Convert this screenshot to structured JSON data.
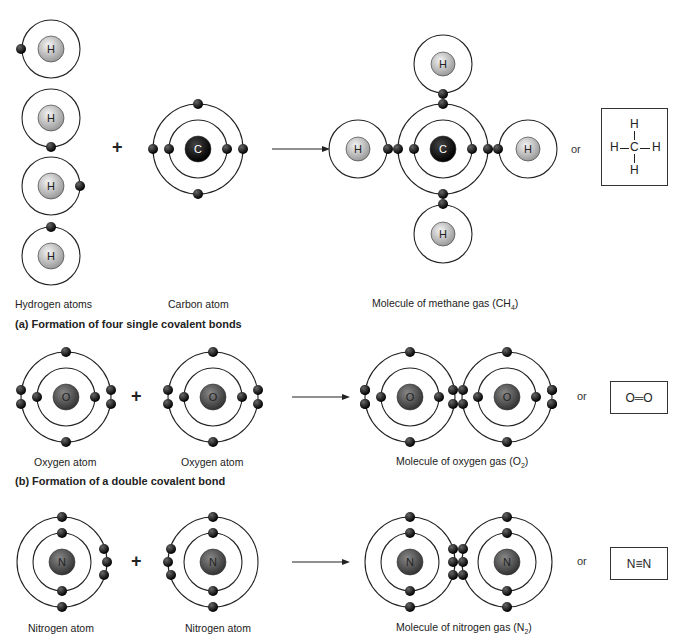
{
  "section_a": {
    "caption": "(a) Formation of four single covalent bonds",
    "hydrogen_label": "Hydrogen atoms",
    "carbon_label": "Carbon atom",
    "methane_label": "Molecule of methane gas (CH",
    "methane_sub": "4",
    "methane_close": ")",
    "or": "or",
    "plus": "+",
    "structural": {
      "top": "H",
      "left": "H",
      "center": "C",
      "right": "H",
      "bottom": "H"
    },
    "nucleus_h": "H",
    "nucleus_c": "C"
  },
  "section_b": {
    "caption": "(b) Formation of a double covalent bond",
    "oxygen_label_1": "Oxygen atom",
    "oxygen_label_2": "Oxygen atom",
    "molecule_label": "Molecule of oxygen gas (O",
    "molecule_sub": "2",
    "molecule_close": ")",
    "or": "or",
    "plus": "+",
    "formula": "O═O",
    "nucleus": "O"
  },
  "section_c": {
    "nitrogen_label_1": "Nitrogen atom",
    "nitrogen_label_2": "Nitrogen atom",
    "molecule_label": "Molecule of nitrogen gas (N",
    "molecule_sub": "2",
    "molecule_close": ")",
    "or": "or",
    "plus": "+",
    "formula": "N≡N",
    "nucleus": "N"
  },
  "colors": {
    "electron": "#111111",
    "h_nucleus": "#c8c8c8",
    "c_nucleus": "#0a0a0a",
    "o_nucleus": "#555555",
    "orbit": "#222222"
  }
}
